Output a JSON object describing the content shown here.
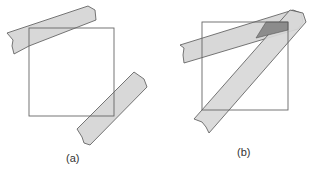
{
  "panels": [
    {
      "id": "a",
      "label": "(a)",
      "square": {
        "x": 29,
        "y": 28,
        "w": 85,
        "h": 88
      },
      "strips": [
        {
          "name": "top-left-strip",
          "points": "7,33 88,6 95,10 96,20 29,46 14,54 12,46 13,40"
        },
        {
          "name": "bottom-right-strip",
          "points": "77,129 134,72 144,79 147,87 90,145 84,143 82,137"
        }
      ]
    },
    {
      "id": "b",
      "label": "(b)",
      "square": {
        "x": 202,
        "y": 22,
        "w": 86,
        "h": 88
      },
      "strips": [
        {
          "name": "horizontal-strip",
          "points": "180,45 293,10 301,13 303,22 298,29 184,63 183,55 184,48"
        },
        {
          "name": "diagonal-strip",
          "points": "194,119 290,10 303,13 306,22 209,133 206,127 202,122"
        }
      ],
      "overlap": {
        "points": "266,22 288,22 288,30 256,38"
      }
    }
  ],
  "colors": {
    "strip_fill": "#d8d8d8",
    "overlap_fill": "#8c8c8c",
    "stroke": "#555555",
    "square_stroke": "#666666"
  }
}
